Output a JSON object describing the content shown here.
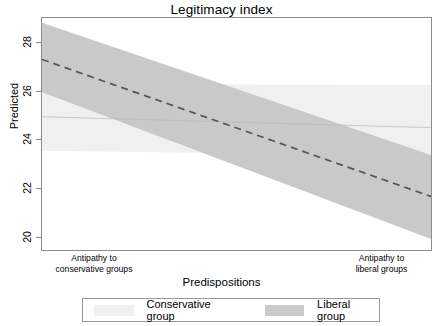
{
  "chart_data": {
    "type": "line",
    "title": "Legitimacy index",
    "xlabel": "Predispositions",
    "ylabel": "Predicted",
    "ylim": [
      19.2,
      28.8
    ],
    "yticks": [
      20,
      22,
      24,
      26,
      28
    ],
    "ytick_labels": [
      "20",
      "22",
      "24",
      "26",
      "28"
    ],
    "xlim": [
      0,
      1
    ],
    "xtick_labels": [
      "Antipathy to\nconservative groups",
      "Antipathy to\nliberal groups"
    ],
    "grid": false,
    "legend_position": "bottom",
    "series": [
      {
        "name": "Conservative group",
        "color": "#f0f0f0",
        "line_color": "#b9b9b9",
        "line_style": "solid",
        "x": [
          0,
          1
        ],
        "y": [
          24.75,
          24.3
        ],
        "ci_lower": [
          23.35,
          23.15
        ],
        "ci_upper": [
          26.1,
          26.05
        ]
      },
      {
        "name": "Liberal group",
        "color": "#c9c9c9",
        "line_color": "#555555",
        "line_style": "dashed",
        "x": [
          0,
          1
        ],
        "y": [
          27.1,
          21.45
        ],
        "ci_lower": [
          25.75,
          19.7
        ],
        "ci_upper": [
          28.6,
          23.15
        ]
      }
    ]
  },
  "legend": {
    "items": [
      {
        "label": "Conservative group",
        "color": "#f0f0f0"
      },
      {
        "label": "Liberal group",
        "color": "#cbcbcb"
      }
    ]
  },
  "axes": {
    "x_left_caption": "Antipathy to\nconservative groups",
    "x_right_caption": "Antipathy to\nliberal groups",
    "y_ticks": [
      "28",
      "26",
      "24",
      "22",
      "20"
    ]
  }
}
